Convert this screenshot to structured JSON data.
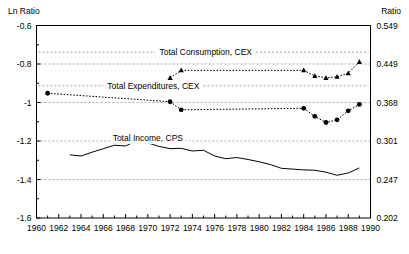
{
  "chart_data": {
    "type": "line",
    "title": "",
    "subtitle": "",
    "xlabel": "",
    "ylabel": "Ln Ratio",
    "y2label": "Ratio",
    "xlim": [
      1960,
      1990
    ],
    "ylim": [
      -1.6,
      -0.6
    ],
    "grid": true,
    "grid_axis": "y",
    "legend_position": "inline-annotations",
    "xticks": [
      1960,
      1962,
      1964,
      1966,
      1968,
      1970,
      1972,
      1974,
      1976,
      1978,
      1980,
      1982,
      1984,
      1986,
      1988,
      1990
    ],
    "xtick_labels": [
      "1960",
      "1962",
      "1964",
      "1966",
      "1968",
      "1970",
      "1972",
      "1974",
      "1976",
      "1978",
      "1980",
      "1982",
      "1984",
      "1986",
      "1988",
      "1990"
    ],
    "xminor_interval": 1,
    "yticks": [
      -0.6,
      -0.8,
      -1.0,
      -1.2,
      -1.4,
      -1.6
    ],
    "ytick_labels": [
      "-0.6",
      "-0.8",
      "-1",
      "-1.2",
      "-1.4",
      "-1.6"
    ],
    "y2tick_labels": [
      "0.549",
      "0.449",
      "0.368",
      "0.301",
      "0.247",
      "0.202"
    ],
    "series": [
      {
        "name": "Total Consumption, CEX",
        "label": "Total Consumption, CEX",
        "marker": "triangle",
        "line_style": "dotted",
        "color": "#000000",
        "label_x": 1975.2,
        "label_y": -0.755,
        "points": [
          {
            "x": 1972,
            "y": -0.872
          },
          {
            "x": 1973,
            "y": -0.833
          },
          {
            "x": 1984,
            "y": -0.833
          },
          {
            "x": 1985,
            "y": -0.862
          },
          {
            "x": 1986,
            "y": -0.872
          },
          {
            "x": 1987,
            "y": -0.866
          },
          {
            "x": 1988,
            "y": -0.848
          },
          {
            "x": 1989,
            "y": -0.789
          }
        ]
      },
      {
        "name": "Total Expenditures, CEX",
        "label": "Total Expenditures, CEX",
        "marker": "circle",
        "line_style": "dotted",
        "color": "#000000",
        "label_x": 1970.5,
        "label_y": -0.93,
        "points": [
          {
            "x": 1961,
            "y": -0.952
          },
          {
            "x": 1972,
            "y": -0.996
          },
          {
            "x": 1973,
            "y": -1.038
          },
          {
            "x": 1984,
            "y": -1.03
          },
          {
            "x": 1985,
            "y": -1.072
          },
          {
            "x": 1986,
            "y": -1.104
          },
          {
            "x": 1987,
            "y": -1.09
          },
          {
            "x": 1988,
            "y": -1.043
          },
          {
            "x": 1989,
            "y": -1.01
          }
        ]
      },
      {
        "name": "Total Income, CPS",
        "label": "Total Income, CPS",
        "marker": "none",
        "line_style": "solid",
        "color": "#000000",
        "label_x": 1970.0,
        "label_y": -1.202,
        "points": [
          {
            "x": 1963,
            "y": -1.272
          },
          {
            "x": 1964,
            "y": -1.278
          },
          {
            "x": 1965,
            "y": -1.258
          },
          {
            "x": 1966,
            "y": -1.24
          },
          {
            "x": 1967,
            "y": -1.222
          },
          {
            "x": 1968,
            "y": -1.226
          },
          {
            "x": 1969,
            "y": -1.198
          },
          {
            "x": 1970,
            "y": -1.21
          },
          {
            "x": 1971,
            "y": -1.228
          },
          {
            "x": 1972,
            "y": -1.24
          },
          {
            "x": 1973,
            "y": -1.238
          },
          {
            "x": 1974,
            "y": -1.252
          },
          {
            "x": 1975,
            "y": -1.248
          },
          {
            "x": 1976,
            "y": -1.278
          },
          {
            "x": 1977,
            "y": -1.292
          },
          {
            "x": 1978,
            "y": -1.286
          },
          {
            "x": 1979,
            "y": -1.296
          },
          {
            "x": 1980,
            "y": -1.308
          },
          {
            "x": 1981,
            "y": -1.322
          },
          {
            "x": 1982,
            "y": -1.342
          },
          {
            "x": 1983,
            "y": -1.346
          },
          {
            "x": 1984,
            "y": -1.35
          },
          {
            "x": 1985,
            "y": -1.352
          },
          {
            "x": 1986,
            "y": -1.362
          },
          {
            "x": 1987,
            "y": -1.378
          },
          {
            "x": 1988,
            "y": -1.366
          },
          {
            "x": 1989,
            "y": -1.34
          }
        ]
      }
    ]
  }
}
